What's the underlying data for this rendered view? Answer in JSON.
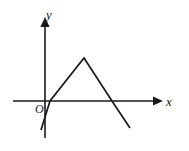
{
  "figure": {
    "background_color": "#ffffff",
    "stroke_color": "#1a1a1a",
    "axis_stroke_width": 1.6,
    "curve_stroke_width": 1.7
  },
  "labels": {
    "y_axis": "y",
    "x_axis": "x",
    "origin": "O"
  },
  "chart_data": {
    "type": "line",
    "title": "",
    "xlabel": "x",
    "ylabel": "y",
    "grid": false,
    "legend": false,
    "axes": {
      "origin_px": [
        45,
        101
      ],
      "x_axis_px": {
        "x1": 13,
        "y1": 101,
        "x2": 160,
        "y2": 101,
        "arrow": "right"
      },
      "y_axis_px": {
        "x1": 45,
        "y1": 138,
        "x2": 45,
        "y2": 20,
        "arrow": "up"
      }
    },
    "series": [
      {
        "name": "tent-graph",
        "points_px": [
          [
            41,
            130
          ],
          [
            50,
            101
          ],
          [
            84,
            58
          ],
          [
            112,
            101
          ],
          [
            130,
            128
          ]
        ],
        "x_intercepts_px": [
          50,
          112
        ],
        "apex_px": [
          84,
          58
        ],
        "description": "rises from below the x-axis at lower left, crosses the x-axis just right of the origin, peaks, then falls through a second x-axis crossing to a lower-right endpoint"
      }
    ]
  }
}
